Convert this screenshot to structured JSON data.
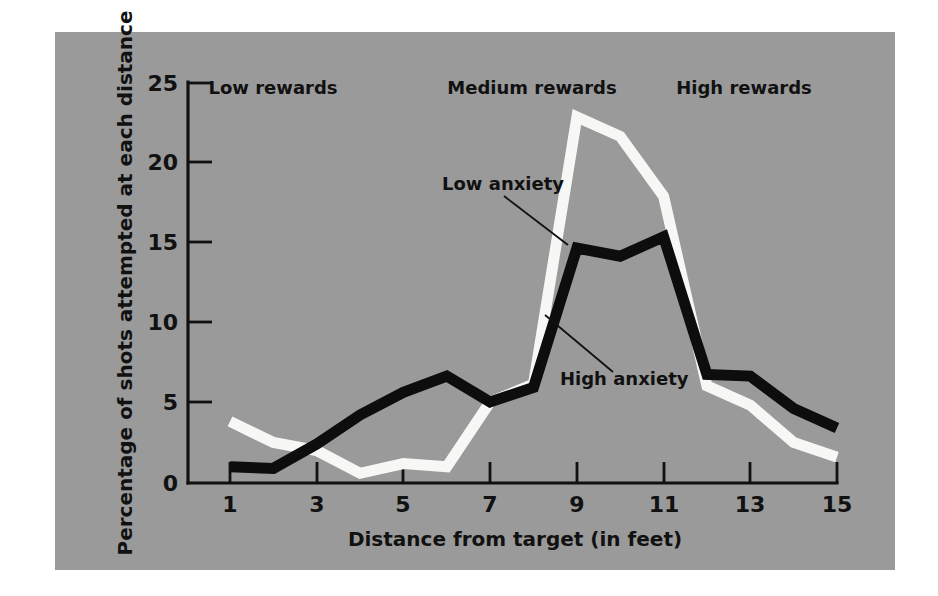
{
  "chart_data": {
    "type": "line",
    "title": "",
    "xlabel": "Distance from target (in feet)",
    "ylabel": "Percentage of shots attempted at each distance",
    "xlim": [
      1,
      15
    ],
    "ylim": [
      0,
      25
    ],
    "grid": false,
    "legend_position": "inline-annotations",
    "x": [
      1,
      2,
      3,
      4,
      5,
      6,
      7,
      8,
      9,
      10,
      11,
      12,
      13,
      14,
      15
    ],
    "xticks": [
      "1",
      "3",
      "5",
      "7",
      "9",
      "11",
      "13",
      "15"
    ],
    "xtick_values": [
      1,
      3,
      5,
      7,
      9,
      11,
      13,
      15
    ],
    "yticks": [
      "0",
      "5",
      "10",
      "15",
      "20",
      "25"
    ],
    "ytick_values": [
      0,
      5,
      10,
      15,
      20,
      25
    ],
    "series": [
      {
        "name": "Low anxiety",
        "color": "#f7f7f5",
        "values": [
          3.8,
          2.5,
          2.0,
          0.6,
          1.2,
          1.0,
          5.0,
          6.1,
          22.6,
          21.4,
          17.7,
          6.0,
          4.8,
          2.5,
          1.6
        ]
      },
      {
        "name": "High anxiety",
        "color": "#0d0d0d",
        "values": [
          1.0,
          0.9,
          2.4,
          4.2,
          5.6,
          6.6,
          5.0,
          5.9,
          14.5,
          14.0,
          15.2,
          6.7,
          6.6,
          4.6,
          3.4
        ]
      }
    ],
    "annotations": [
      {
        "text": "Low rewards",
        "x_center": 3.3,
        "y_pixel": 88
      },
      {
        "text": "Medium rewards",
        "x_center": 9.0,
        "y_pixel": 88
      },
      {
        "text": "High rewards",
        "x_center": 13.0,
        "y_pixel": 88
      },
      {
        "text": "Low anxiety",
        "x_center": 6.6,
        "y_pixel": 190
      },
      {
        "text": "High anxiety",
        "x_center": 9.1,
        "y_pixel": 378
      }
    ],
    "background_color": "#9a9a9a",
    "figure_color": "#ffffff"
  },
  "axes": {
    "x_title": "Distance from target (in feet)",
    "y_title": "Percentage of shots attempted at each distance",
    "x_tick_labels": [
      "1",
      "3",
      "5",
      "7",
      "9",
      "11",
      "13",
      "15"
    ],
    "y_tick_labels": [
      "25",
      "20",
      "15",
      "10",
      "5",
      "0"
    ]
  },
  "labels": {
    "region_low": "Low rewards",
    "region_medium": "Medium rewards",
    "region_high": "High rewards",
    "series_low_anxiety": "Low anxiety",
    "series_high_anxiety": "High anxiety"
  }
}
